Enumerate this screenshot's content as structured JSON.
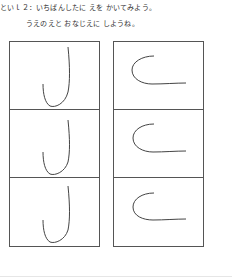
{
  "question": {
    "title": "といｌ２：いちばんしたに えを かいてみよう。",
    "subtitle": "うえのえと おなじえに しようね。"
  },
  "grid": {
    "left_column": {
      "shape": "j-hook-stroke",
      "rows": 3
    },
    "right_column": {
      "shape": "c-curve-stroke",
      "rows": 3
    }
  },
  "colors": {
    "border": "#555555",
    "stroke": "#444444"
  }
}
